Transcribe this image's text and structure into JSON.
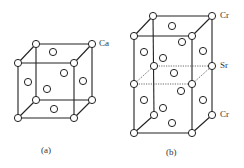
{
  "figure_a": {
    "caption": "(a)",
    "atom_label": "Ca"
  },
  "figure_b": {
    "caption": "(b)",
    "labels": [
      "Cr",
      "Sr",
      "Cr"
    ]
  }
}
